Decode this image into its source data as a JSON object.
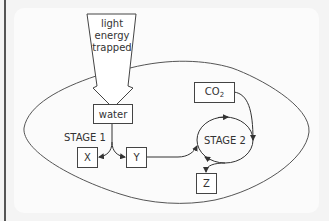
{
  "diagram": {
    "arrow_label_lines": [
      "light",
      "energy",
      "trapped"
    ],
    "nodes": {
      "water": "water",
      "x": "X",
      "y": "Y",
      "z": "Z",
      "co2_main": "CO",
      "co2_sub": "2",
      "stage2": "STAGE 2"
    },
    "stage1_label": "STAGE 1",
    "colors": {
      "line": "#444444",
      "background": "#fbfbfb",
      "left_rule": "#555555"
    }
  }
}
